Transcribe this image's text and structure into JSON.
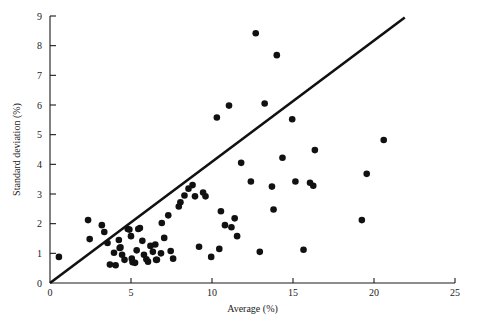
{
  "chart_data": {
    "type": "scatter",
    "title": "",
    "xlabel": "Average (%)",
    "ylabel": "Standard deviation (%)",
    "xlim": [
      0,
      25
    ],
    "ylim": [
      0,
      9
    ],
    "xticks": [
      0,
      5,
      10,
      15,
      20,
      25
    ],
    "yticks": [
      0,
      1,
      2,
      3,
      4,
      5,
      6,
      7,
      8,
      9
    ],
    "xtick_labels": [
      "0",
      "5",
      "10",
      "15",
      "20",
      "25"
    ],
    "ytick_labels": [
      "0",
      "1",
      "2",
      "3",
      "4",
      "5",
      "6",
      "7",
      "8",
      "9"
    ],
    "grid": false,
    "legend": false,
    "legend_position": "none",
    "marker": "filled-circle",
    "marker_color": "#111111",
    "marker_size_px": 3.3,
    "reference_line": {
      "name": "identity-proportional-line",
      "type": "line",
      "x": [
        0.0,
        21.9
      ],
      "y": [
        0.0,
        8.95
      ],
      "slope": 0.409,
      "intercept": 0.0,
      "color": "#111111",
      "width_px": 2.6
    },
    "points": [
      [
        0.55,
        0.88
      ],
      [
        2.35,
        2.12
      ],
      [
        2.45,
        1.48
      ],
      [
        3.2,
        1.95
      ],
      [
        3.35,
        1.72
      ],
      [
        3.55,
        1.35
      ],
      [
        3.7,
        0.62
      ],
      [
        3.95,
        1.02
      ],
      [
        4.05,
        0.6
      ],
      [
        4.25,
        1.45
      ],
      [
        4.3,
        1.18
      ],
      [
        4.35,
        1.2
      ],
      [
        4.45,
        0.95
      ],
      [
        4.6,
        0.78
      ],
      [
        4.8,
        1.82
      ],
      [
        4.9,
        1.8
      ],
      [
        5.0,
        1.58
      ],
      [
        5.05,
        0.82
      ],
      [
        5.1,
        0.7
      ],
      [
        5.25,
        0.68
      ],
      [
        5.35,
        1.1
      ],
      [
        5.45,
        1.82
      ],
      [
        5.55,
        1.85
      ],
      [
        5.7,
        1.42
      ],
      [
        5.8,
        0.95
      ],
      [
        5.95,
        0.8
      ],
      [
        6.05,
        0.72
      ],
      [
        6.2,
        1.25
      ],
      [
        6.35,
        1.05
      ],
      [
        6.5,
        1.3
      ],
      [
        6.55,
        0.78
      ],
      [
        6.6,
        0.78
      ],
      [
        6.85,
        1.0
      ],
      [
        6.9,
        2.02
      ],
      [
        7.05,
        1.52
      ],
      [
        7.3,
        2.28
      ],
      [
        7.45,
        1.08
      ],
      [
        7.6,
        0.82
      ],
      [
        7.95,
        2.58
      ],
      [
        8.05,
        2.72
      ],
      [
        8.3,
        2.95
      ],
      [
        8.55,
        3.18
      ],
      [
        8.8,
        3.3
      ],
      [
        8.95,
        2.92
      ],
      [
        9.2,
        1.22
      ],
      [
        9.45,
        3.05
      ],
      [
        9.6,
        2.92
      ],
      [
        9.95,
        0.88
      ],
      [
        10.3,
        5.58
      ],
      [
        10.45,
        1.15
      ],
      [
        10.55,
        2.42
      ],
      [
        10.8,
        1.95
      ],
      [
        11.05,
        5.98
      ],
      [
        11.2,
        1.88
      ],
      [
        11.4,
        2.18
      ],
      [
        11.55,
        1.58
      ],
      [
        11.8,
        4.05
      ],
      [
        12.4,
        3.42
      ],
      [
        12.7,
        8.42
      ],
      [
        12.95,
        1.05
      ],
      [
        13.25,
        6.05
      ],
      [
        13.7,
        3.25
      ],
      [
        13.8,
        2.48
      ],
      [
        14.0,
        7.68
      ],
      [
        14.35,
        4.22
      ],
      [
        14.95,
        5.52
      ],
      [
        15.15,
        3.42
      ],
      [
        15.65,
        1.12
      ],
      [
        16.05,
        3.38
      ],
      [
        16.25,
        3.28
      ],
      [
        16.35,
        4.48
      ],
      [
        19.25,
        2.12
      ],
      [
        19.55,
        3.68
      ],
      [
        20.6,
        4.82
      ]
    ]
  }
}
